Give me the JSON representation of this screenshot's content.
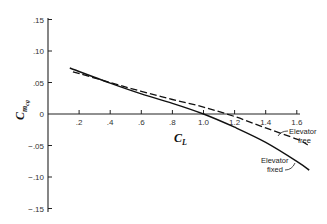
{
  "chart_data": {
    "type": "line",
    "title": "",
    "xlabel": "C_L",
    "ylabel": "C_m_cg",
    "xlim": [
      0,
      1.7
    ],
    "ylim": [
      -0.15,
      0.15
    ],
    "grid": false,
    "x_ticks": [
      ".2",
      ".4",
      ".6",
      ".8",
      "1.0",
      "1.2",
      "1.4",
      "1.6"
    ],
    "y_ticks": [
      ".15",
      ".10",
      ".05",
      "0",
      "-.05",
      "-.10",
      "-.15"
    ],
    "series": [
      {
        "name": "Elevator fixed",
        "style": "solid",
        "x": [
          0.14,
          0.4,
          0.6,
          0.8,
          1.0,
          1.2,
          1.4,
          1.6,
          1.68
        ],
        "y": [
          0.073,
          0.049,
          0.032,
          0.017,
          0.0,
          -0.021,
          -0.045,
          -0.075,
          -0.089
        ]
      },
      {
        "name": "Elevator free",
        "style": "dashed",
        "x": [
          0.16,
          0.4,
          0.6,
          0.8,
          1.0,
          1.2,
          1.4,
          1.6,
          1.67
        ],
        "y": [
          0.067,
          0.05,
          0.036,
          0.023,
          0.011,
          -0.004,
          -0.022,
          -0.04,
          -0.049
        ]
      }
    ],
    "annotations": [
      {
        "text_line1": "Elevator",
        "text_line2": "free",
        "points_to": "Elevator free"
      },
      {
        "text_line1": "Elevator",
        "text_line2": "fixed",
        "points_to": "Elevator fixed"
      }
    ]
  },
  "labels": {
    "xlabel_main": "C",
    "xlabel_sub": "L",
    "ylabel_main": "C",
    "ylabel_sub": "m",
    "ylabel_subsub": "cg",
    "annot_free_1": "Elevator",
    "annot_free_2": "free",
    "annot_fixed_1": "Elevator",
    "annot_fixed_2": "fixed"
  }
}
